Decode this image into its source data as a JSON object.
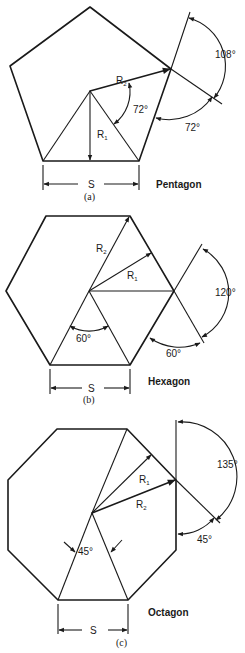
{
  "figures": [
    {
      "id": "a",
      "caption": "(a)",
      "name": "Pentagon",
      "side_label": "S",
      "r1_label": "R",
      "r1_sub": "1",
      "r2_label": "R",
      "r2_sub": "2",
      "center_angle": "72°",
      "exterior_angle": "72°",
      "interior_angle": "108°"
    },
    {
      "id": "b",
      "caption": "(b)",
      "name": "Hexagon",
      "side_label": "S",
      "r1_label": "R",
      "r1_sub": "1",
      "r2_label": "R",
      "r2_sub": "2",
      "center_angle": "60°",
      "exterior_angle": "60°",
      "interior_angle": "120°"
    },
    {
      "id": "c",
      "caption": "(c)",
      "name": "Octagon",
      "side_label": "S",
      "r1_label": "R",
      "r1_sub": "1",
      "r2_label": "R",
      "r2_sub": "2",
      "center_angle": "45°",
      "exterior_angle": "45°",
      "interior_angle": "135°"
    }
  ]
}
